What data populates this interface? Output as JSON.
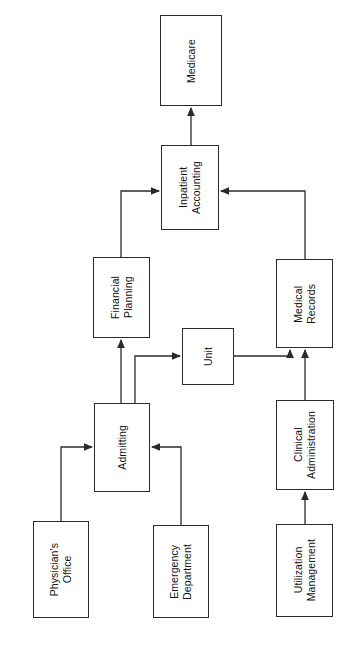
{
  "diagram": {
    "type": "flowchart",
    "orientation": "rotated-90-ccw",
    "background_color": "#ffffff",
    "line_color": "#2b2b2b",
    "text_color": "#121212",
    "nodes": [
      {
        "id": "medicare",
        "label": "Medicare",
        "x": 160,
        "y": 15,
        "width": 62,
        "height": 91
      },
      {
        "id": "inpatient-accounting",
        "label": "Inpatient\nAccounting",
        "x": 161,
        "y": 145,
        "width": 58,
        "height": 85
      },
      {
        "id": "financial-planning",
        "label": "Financial\nPlanning",
        "x": 93,
        "y": 257,
        "width": 57,
        "height": 81
      },
      {
        "id": "medical-records",
        "label": "Medical\nRecords",
        "x": 276,
        "y": 259,
        "width": 57,
        "height": 89
      },
      {
        "id": "unit",
        "label": "Unit",
        "x": 182,
        "y": 328,
        "width": 52,
        "height": 57
      },
      {
        "id": "admitting",
        "label": "Admitting",
        "x": 94,
        "y": 403,
        "width": 56,
        "height": 89
      },
      {
        "id": "clinical-administration",
        "label": "Clinical\nAdministration",
        "x": 276,
        "y": 400,
        "width": 58,
        "height": 90
      },
      {
        "id": "physicians-office",
        "label": "Physician's\nOffice",
        "x": 33,
        "y": 521,
        "width": 56,
        "height": 97
      },
      {
        "id": "emergency-department",
        "label": "Emergency\nDepartment",
        "x": 153,
        "y": 525,
        "width": 56,
        "height": 93
      },
      {
        "id": "utilization-management",
        "label": "Utilization\nManagement",
        "x": 276,
        "y": 524,
        "width": 57,
        "height": 93
      }
    ],
    "edges": [
      {
        "id": "inpatient-accounting-to-medicare",
        "from": "inpatient-accounting",
        "to": "medicare",
        "points": "191,145 191,108"
      },
      {
        "id": "financial-planning-to-inpatient-accounting",
        "from": "financial-planning",
        "to": "inpatient-accounting",
        "points": "121,257 121,191 159,191"
      },
      {
        "id": "medical-records-to-inpatient-accounting",
        "from": "medical-records",
        "to": "inpatient-accounting",
        "points": "305,259 305,191 221,191"
      },
      {
        "id": "admitting-to-financial-planning",
        "from": "admitting",
        "to": "financial-planning",
        "points": "121,403 121,340"
      },
      {
        "id": "admitting-to-unit",
        "from": "admitting",
        "to": "unit",
        "points": "135,403 135,356 180,356"
      },
      {
        "id": "unit-to-medical-records",
        "from": "unit",
        "to": "medical-records",
        "points": "234,356 290,356 290,350"
      },
      {
        "id": "clinical-administration-to-medical-records",
        "from": "clinical-administration",
        "to": "medical-records",
        "points": "305,400 305,350"
      },
      {
        "id": "utilization-management-to-clinical-administration",
        "from": "utilization-management",
        "to": "clinical-administration",
        "points": "305,524 305,492"
      },
      {
        "id": "physicians-office-to-admitting",
        "from": "physicians-office",
        "to": "admitting",
        "points": "61,521 61,447 92,447"
      },
      {
        "id": "emergency-department-to-admitting",
        "from": "emergency-department",
        "to": "admitting",
        "points": "181,525 181,447 152,447"
      }
    ]
  }
}
